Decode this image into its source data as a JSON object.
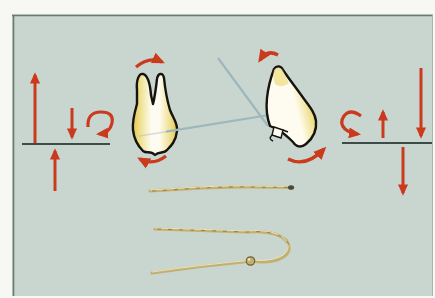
{
  "labels": {
    "figure": "Orthodontic force diagram: upright molar and tipped incisor with red force arrows, occlusal plane lines, a straight spring wire and a loop spring wire",
    "left_force_system": "Left force system: large upward arrow, small downward arrow, clockwise moment arrow, upward arrow below occlusal line",
    "left_tooth": "Upright two-rooted molar with rotation arcs above and below",
    "axis_lines": "Two crossing long-axis force lines between the teeth",
    "right_tooth": "Tipped incisor with rotation arcs and a small bracket at the cervical area",
    "right_force_system": "Right force system: counterclockwise moment arrow, small upward arrow, large downward arrow, downward arrow below occlusal line",
    "straight_wire": "Straight spring wire with darkened tip",
    "loop_wire": "Hairpin loop spring wire with stop bead"
  },
  "elements": {
    "left_arrows": [
      "long-up",
      "short-down",
      "clockwise-moment",
      "up-from-below-line"
    ],
    "right_arrows": [
      "counterclockwise-moment",
      "short-up",
      "long-down",
      "down-below-line"
    ],
    "left_tooth_rotation_arcs": [
      "top-arc-pointing-right",
      "bottom-arc-pointing-left"
    ],
    "right_tooth_rotation_arcs": [
      "top-arc-pointing-left",
      "bottom-arc-pointing-right"
    ],
    "wires": [
      "straight-spring",
      "loop-spring-with-bead"
    ]
  },
  "colors": {
    "page": "#f7f7f3",
    "panel": "#c8d6cf",
    "panel_border": "#6f7a75",
    "panel_border_soft": "#a9b4af",
    "arrow_red": "#cc3a1d",
    "baseline": "#3e4b47",
    "axis_line": "#9fb7bc",
    "tooth_outline": "#17130f",
    "tooth_white": "#fefcf1",
    "tooth_yellow": "#eedd84",
    "tooth_yellow_deep": "#dfc453",
    "wire_gold": "#c3b070",
    "wire_dark": "#6f6134",
    "wire_highlight": "#efe7c4",
    "wire_tip": "#4e4733"
  }
}
